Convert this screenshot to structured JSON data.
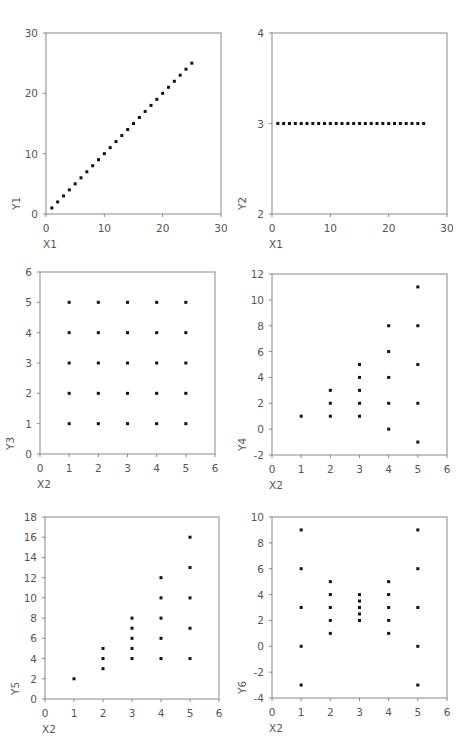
{
  "chart_data": [
    {
      "type": "scatter",
      "title": "",
      "xlabel": "X1",
      "ylabel": "Y1",
      "xlim": [
        0,
        30
      ],
      "ylim": [
        0,
        30
      ],
      "xticks": [
        0,
        10,
        20,
        30
      ],
      "yticks": [
        0,
        10,
        20,
        30
      ],
      "grid": false,
      "box": {
        "left": 46,
        "top": 33,
        "right": 221,
        "bottom": 214
      },
      "points": [
        [
          1,
          1
        ],
        [
          2,
          2
        ],
        [
          3,
          3
        ],
        [
          4,
          4
        ],
        [
          5,
          5
        ],
        [
          6,
          6
        ],
        [
          7,
          7
        ],
        [
          8,
          8
        ],
        [
          9,
          9
        ],
        [
          10,
          10
        ],
        [
          11,
          11
        ],
        [
          12,
          12
        ],
        [
          13,
          13
        ],
        [
          14,
          14
        ],
        [
          15,
          15
        ],
        [
          16,
          16
        ],
        [
          17,
          17
        ],
        [
          18,
          18
        ],
        [
          19,
          19
        ],
        [
          20,
          20
        ],
        [
          21,
          21
        ],
        [
          22,
          22
        ],
        [
          23,
          23
        ],
        [
          24,
          24
        ],
        [
          25,
          25
        ]
      ]
    },
    {
      "type": "scatter",
      "title": "",
      "xlabel": "X1",
      "ylabel": "Y2",
      "xlim": [
        0,
        30
      ],
      "ylim": [
        2,
        4
      ],
      "xticks": [
        0,
        10,
        20,
        30
      ],
      "yticks": [
        2,
        3,
        4
      ],
      "grid": false,
      "box": {
        "left": 272,
        "top": 33,
        "right": 447,
        "bottom": 214
      },
      "points": [
        [
          1,
          3
        ],
        [
          2,
          3
        ],
        [
          3,
          3
        ],
        [
          4,
          3
        ],
        [
          5,
          3
        ],
        [
          6,
          3
        ],
        [
          7,
          3
        ],
        [
          8,
          3
        ],
        [
          9,
          3
        ],
        [
          10,
          3
        ],
        [
          11,
          3
        ],
        [
          12,
          3
        ],
        [
          13,
          3
        ],
        [
          14,
          3
        ],
        [
          15,
          3
        ],
        [
          16,
          3
        ],
        [
          17,
          3
        ],
        [
          18,
          3
        ],
        [
          19,
          3
        ],
        [
          20,
          3
        ],
        [
          21,
          3
        ],
        [
          22,
          3
        ],
        [
          23,
          3
        ],
        [
          24,
          3
        ],
        [
          25,
          3
        ],
        [
          26,
          3
        ]
      ]
    },
    {
      "type": "scatter",
      "title": "",
      "xlabel": "X2",
      "ylabel": "Y3",
      "xlim": [
        0,
        6
      ],
      "ylim": [
        0,
        6
      ],
      "xticks": [
        0,
        1,
        2,
        3,
        4,
        5,
        6
      ],
      "yticks": [
        0,
        1,
        2,
        3,
        4,
        5,
        6
      ],
      "grid": false,
      "box": {
        "left": 40,
        "top": 272,
        "right": 215,
        "bottom": 454
      },
      "points": [
        [
          1,
          1
        ],
        [
          1,
          2
        ],
        [
          1,
          3
        ],
        [
          1,
          4
        ],
        [
          1,
          5
        ],
        [
          2,
          1
        ],
        [
          2,
          2
        ],
        [
          2,
          3
        ],
        [
          2,
          4
        ],
        [
          2,
          5
        ],
        [
          3,
          1
        ],
        [
          3,
          2
        ],
        [
          3,
          3
        ],
        [
          3,
          4
        ],
        [
          3,
          5
        ],
        [
          4,
          1
        ],
        [
          4,
          2
        ],
        [
          4,
          3
        ],
        [
          4,
          4
        ],
        [
          4,
          5
        ],
        [
          5,
          1
        ],
        [
          5,
          2
        ],
        [
          5,
          3
        ],
        [
          5,
          4
        ],
        [
          5,
          5
        ]
      ]
    },
    {
      "type": "scatter",
      "title": "",
      "xlabel": "X2",
      "ylabel": "Y4",
      "xlim": [
        0,
        6
      ],
      "ylim": [
        -2,
        12
      ],
      "xticks": [
        0,
        1,
        2,
        3,
        4,
        5,
        6
      ],
      "yticks": [
        -2,
        0,
        2,
        4,
        6,
        8,
        10,
        12
      ],
      "grid": false,
      "box": {
        "left": 272,
        "top": 274,
        "right": 447,
        "bottom": 455
      },
      "points": [
        [
          1,
          1
        ],
        [
          2,
          1
        ],
        [
          2,
          2
        ],
        [
          2,
          3
        ],
        [
          3,
          1
        ],
        [
          3,
          2
        ],
        [
          3,
          3
        ],
        [
          3,
          4
        ],
        [
          3,
          5
        ],
        [
          4,
          0
        ],
        [
          4,
          2
        ],
        [
          4,
          4
        ],
        [
          4,
          6
        ],
        [
          4,
          8
        ],
        [
          5,
          -1
        ],
        [
          5,
          2
        ],
        [
          5,
          5
        ],
        [
          5,
          8
        ],
        [
          5,
          11
        ]
      ]
    },
    {
      "type": "scatter",
      "title": "",
      "xlabel": "X2",
      "ylabel": "Y5",
      "xlim": [
        0,
        6
      ],
      "ylim": [
        0,
        18
      ],
      "xticks": [
        0,
        1,
        2,
        3,
        4,
        5,
        6
      ],
      "yticks": [
        0,
        2,
        4,
        6,
        8,
        10,
        12,
        14,
        16,
        18
      ],
      "grid": false,
      "box": {
        "left": 45,
        "top": 517,
        "right": 219,
        "bottom": 699
      },
      "points": [
        [
          1,
          2
        ],
        [
          2,
          3
        ],
        [
          2,
          4
        ],
        [
          2,
          5
        ],
        [
          3,
          4
        ],
        [
          3,
          5
        ],
        [
          3,
          6
        ],
        [
          3,
          7
        ],
        [
          3,
          8
        ],
        [
          4,
          4
        ],
        [
          4,
          6
        ],
        [
          4,
          8
        ],
        [
          4,
          10
        ],
        [
          4,
          12
        ],
        [
          5,
          4
        ],
        [
          5,
          7
        ],
        [
          5,
          10
        ],
        [
          5,
          13
        ],
        [
          5,
          16
        ]
      ]
    },
    {
      "type": "scatter",
      "title": "",
      "xlabel": "X2",
      "ylabel": "Y6",
      "xlim": [
        0,
        6
      ],
      "ylim": [
        -4,
        10
      ],
      "xticks": [
        0,
        1,
        2,
        3,
        4,
        5,
        6
      ],
      "yticks": [
        -4,
        -2,
        0,
        2,
        4,
        6,
        8,
        10
      ],
      "grid": false,
      "box": {
        "left": 272,
        "top": 517,
        "right": 447,
        "bottom": 698
      },
      "points": [
        [
          1,
          -3
        ],
        [
          1,
          0
        ],
        [
          1,
          3
        ],
        [
          1,
          6
        ],
        [
          1,
          9
        ],
        [
          2,
          1
        ],
        [
          2,
          2
        ],
        [
          2,
          3
        ],
        [
          2,
          4
        ],
        [
          2,
          5
        ],
        [
          3,
          2
        ],
        [
          3,
          2.5
        ],
        [
          3,
          3
        ],
        [
          3,
          3.5
        ],
        [
          3,
          4
        ],
        [
          4,
          1
        ],
        [
          4,
          2
        ],
        [
          4,
          3
        ],
        [
          4,
          4
        ],
        [
          4,
          5
        ],
        [
          5,
          -3
        ],
        [
          5,
          0
        ],
        [
          5,
          3
        ],
        [
          5,
          6
        ],
        [
          5,
          9
        ]
      ]
    }
  ],
  "style": {
    "axis_color": "#888888",
    "point_color": "#111111",
    "text_color": "#555555"
  }
}
